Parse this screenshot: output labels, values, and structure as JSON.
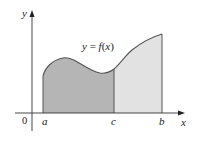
{
  "figure": {
    "curve_label": "y = f(x)",
    "axis_labels": {
      "x": "x",
      "y": "y",
      "origin": "0"
    },
    "tick_labels": {
      "a": "a",
      "c": "c",
      "b": "b"
    },
    "regions": [
      {
        "name": "region-a-to-c",
        "from": "a",
        "to": "c",
        "fill": "#b5b5b5"
      },
      {
        "name": "region-c-to-b",
        "from": "c",
        "to": "b",
        "fill": "#e2e2e2"
      }
    ],
    "colors": {
      "axis": "#333333",
      "curve": "#555555",
      "dark_fill": "#b5b5b5",
      "light_fill": "#e2e2e2",
      "background": "#ffffff"
    }
  }
}
